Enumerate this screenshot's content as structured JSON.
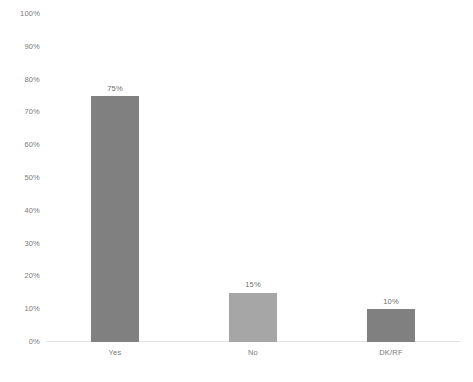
{
  "chart_data": {
    "type": "bar",
    "title": "",
    "subtitle": "",
    "xlabel": "",
    "ylabel": "",
    "categories": [
      "Yes",
      "No",
      "DK/RF"
    ],
    "values": [
      75,
      15,
      10
    ],
    "value_labels": [
      "75%",
      "15%",
      "10%"
    ],
    "bar_colors": [
      "#808080",
      "#a6a6a6",
      "#808080"
    ],
    "ylim": [
      0,
      100
    ],
    "y_ticks": [
      0,
      10,
      20,
      30,
      40,
      50,
      60,
      70,
      80,
      90,
      100
    ],
    "y_tick_labels": [
      "0%",
      "10%",
      "20%",
      "30%",
      "40%",
      "50%",
      "60%",
      "70%",
      "80%",
      "90%",
      "100%"
    ],
    "grid": false,
    "legend": false,
    "legend_position": "none",
    "axis_line_color": "#e2e2e2",
    "tick_label_color": "#7a7a7a",
    "data_label_color": "#6f6f6f",
    "background_color": "#ffffff"
  }
}
